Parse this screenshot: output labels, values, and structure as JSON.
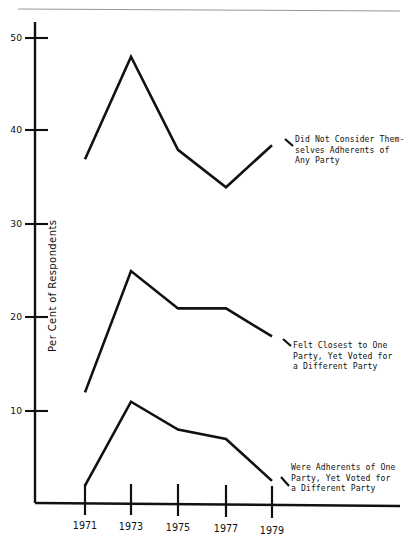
{
  "chart_data": {
    "type": "line",
    "title": "",
    "xlabel": "",
    "ylabel": "Per Cent of Respondents",
    "x": [
      1971,
      1973,
      1975,
      1977,
      1979
    ],
    "xtick_labels": [
      "1971",
      "1973",
      "1975",
      "1977",
      "1979"
    ],
    "ytick_labels": [
      "10",
      "20",
      "30",
      "40",
      "50"
    ],
    "yticks": [
      10,
      20,
      30,
      40,
      50
    ],
    "xlim": [
      1970.2,
      1980.2
    ],
    "ylim": [
      0,
      52
    ],
    "grid": false,
    "legend": "annotations at line ends",
    "series": [
      {
        "name": "Did Not Consider Themselves Adherents of Any Party",
        "values": [
          37,
          48,
          38,
          34,
          38.5
        ],
        "annotation": [
          "Did Not Consider Them-",
          "selves Adherents of",
          "Any Party"
        ]
      },
      {
        "name": "Felt Closest to One Party, Yet Voted for a Different Party",
        "values": [
          12,
          25,
          21,
          21,
          18
        ],
        "annotation": [
          "Felt Closest to One",
          "Party, Yet Voted for",
          "a Different Party"
        ]
      },
      {
        "name": "Were Adherents of One Party, Yet Voted for a Different Party",
        "values": [
          2,
          11,
          8,
          7,
          2.5
        ],
        "annotation": [
          "Were Adherents of One",
          "Party, Yet Voted for",
          "a Different Party"
        ]
      }
    ]
  },
  "axis": {
    "y_label": "Per Cent of Respondents",
    "y_tick_50": "50",
    "y_tick_40": "40",
    "y_tick_30": "30",
    "y_tick_20": "20",
    "y_tick_10": "10",
    "x_tick_1971": "1971",
    "x_tick_1973": "1973",
    "x_tick_1975": "1975",
    "x_tick_1977": "1977",
    "x_tick_1979": "1979"
  },
  "annotations": {
    "top": {
      "line1": "Did Not Consider Them-",
      "line2": "selves Adherents of",
      "line3": "Any Party"
    },
    "middle": {
      "line1": "Felt Closest to One",
      "line2": "Party, Yet Voted for",
      "line3": "a Different Party"
    },
    "bottom": {
      "line1": "Were Adherents of One",
      "line2": "Party, Yet Voted for",
      "line3": "a Different Party"
    }
  },
  "colors": {
    "ink": "#111111",
    "background": "#ffffff"
  }
}
